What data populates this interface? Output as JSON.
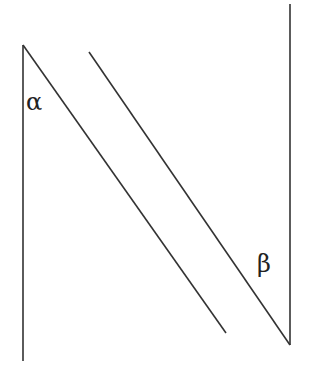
{
  "diagram": {
    "type": "geometry-parallel-lines-angles",
    "stroke_color": "#333333",
    "background": "#ffffff",
    "lines": [
      {
        "name": "left-vertical-line",
        "x1": 23,
        "y1": 45,
        "x2": 23,
        "y2": 361
      },
      {
        "name": "left-diagonal-line",
        "x1": 23,
        "y1": 45,
        "x2": 226,
        "y2": 333
      },
      {
        "name": "right-diagonal-line",
        "x1": 89,
        "y1": 52,
        "x2": 290,
        "y2": 345
      },
      {
        "name": "right-vertical-line",
        "x1": 290,
        "y1": 4,
        "x2": 290,
        "y2": 345
      }
    ],
    "labels": [
      {
        "name": "angle-alpha-label",
        "text": "α",
        "x": 26,
        "y": 110
      },
      {
        "name": "angle-beta-label",
        "text": "β",
        "x": 257,
        "y": 272
      }
    ]
  }
}
